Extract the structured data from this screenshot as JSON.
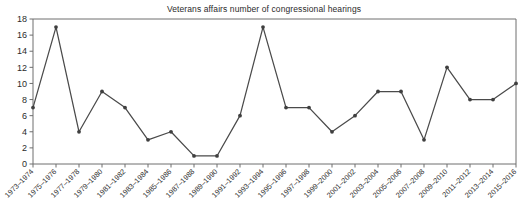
{
  "chart_data": {
    "type": "line",
    "title": "Veterans affairs number of congressional hearings",
    "xlabel": "",
    "ylabel": "",
    "ylim": [
      0,
      18
    ],
    "yticks": [
      0,
      2,
      4,
      6,
      8,
      10,
      12,
      14,
      16,
      18
    ],
    "grid": false,
    "legend": "none",
    "line_color": "#4a4a4a",
    "marker_color": "#3f3f3f",
    "categories": [
      "1973–1974",
      "1975–1976",
      "1977–1978",
      "1979–1980",
      "1981–1982",
      "1983–1984",
      "1985–1986",
      "1987–1988",
      "1989–1990",
      "1991–1992",
      "1993–1994",
      "1995–1996",
      "1997–1998",
      "1999–2000",
      "2001–2002",
      "2003–2004",
      "2005–2006",
      "2007–2008",
      "2009–2010",
      "2011–2012",
      "2013–2014",
      "2015–2016"
    ],
    "values": [
      7,
      17,
      4,
      9,
      7,
      3,
      4,
      1,
      1,
      6,
      17,
      7,
      7,
      4,
      6,
      9,
      9,
      3,
      12,
      8,
      8,
      10
    ]
  }
}
